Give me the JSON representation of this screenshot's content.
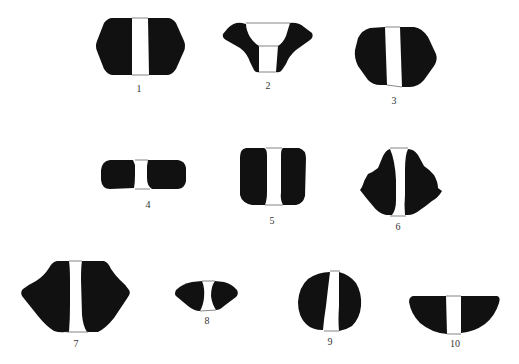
{
  "figure": {
    "colors": {
      "shape_fill": "#111111",
      "bridge_line": "#666666",
      "label": "#333333",
      "background": "#ffffff"
    },
    "items": [
      {
        "id": 1,
        "label": "1"
      },
      {
        "id": 2,
        "label": "2"
      },
      {
        "id": 3,
        "label": "3"
      },
      {
        "id": 4,
        "label": "4"
      },
      {
        "id": 5,
        "label": "5"
      },
      {
        "id": 6,
        "label": "6"
      },
      {
        "id": 7,
        "label": "7"
      },
      {
        "id": 8,
        "label": "8"
      },
      {
        "id": 9,
        "label": "9"
      },
      {
        "id": 10,
        "label": "10"
      }
    ]
  }
}
